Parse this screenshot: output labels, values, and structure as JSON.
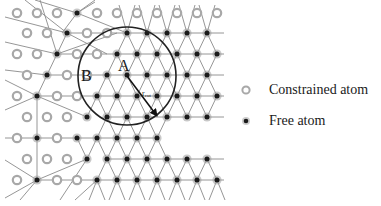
{
  "diagram": {
    "labels": {
      "A": "A",
      "B": "B",
      "r": "r",
      "r_sub": "cut"
    },
    "colors": {
      "bond": "#8a8a8a",
      "circle": "#222222",
      "free_atom": "#1a1a1a",
      "free_halo": "#9a9a9a",
      "constrained_ring": "#a8a8a8",
      "text": "#1a1a1a"
    },
    "cutoff_circle": {
      "cx": 127,
      "cy": 76,
      "r": 49
    },
    "arrow": {
      "x1": 127,
      "y1": 76,
      "x2": 157,
      "y2": 116
    },
    "rows": [
      {
        "y": 13,
        "constrained": [
          17,
          37,
          57,
          97,
          117,
          137,
          157,
          177,
          197,
          217
        ],
        "free": [
          77
        ]
      },
      {
        "y": 33,
        "constrained": [
          27,
          47,
          87,
          107
        ],
        "free": [
          67,
          127,
          147,
          167,
          187,
          207
        ]
      },
      {
        "y": 54,
        "constrained": [
          17,
          37,
          77,
          97
        ],
        "free": [
          57,
          117,
          137,
          157,
          177,
          197,
          217
        ]
      },
      {
        "y": 75,
        "constrained": [
          27,
          67,
          87
        ],
        "free": [
          47,
          107,
          127,
          147,
          167,
          187,
          207
        ]
      },
      {
        "y": 96,
        "constrained": [
          17,
          57,
          77
        ],
        "free": [
          37,
          97,
          117,
          137,
          157,
          177,
          197,
          217
        ]
      },
      {
        "y": 117,
        "constrained": [
          27,
          47,
          67
        ],
        "free": [
          87,
          107,
          127,
          147,
          167,
          187,
          207
        ]
      },
      {
        "y": 138,
        "constrained": [
          17,
          57
        ],
        "free": [
          37,
          77,
          97,
          117,
          137,
          157
        ]
      },
      {
        "y": 159,
        "constrained": [
          27,
          47,
          67
        ],
        "free": [
          87,
          107,
          127,
          147,
          167,
          187,
          207
        ]
      },
      {
        "y": 180,
        "constrained": [
          17,
          57,
          77
        ],
        "free": [
          37,
          97,
          117,
          137,
          157,
          177,
          197,
          217
        ]
      }
    ],
    "extra_bonds": [
      [
        77,
        13,
        35,
        0
      ],
      [
        77,
        13,
        95,
        0
      ],
      [
        77,
        13,
        95,
        2
      ],
      [
        77,
        13,
        62,
        33
      ],
      [
        67,
        33,
        5,
        17
      ],
      [
        67,
        33,
        57,
        54
      ],
      [
        67,
        33,
        127,
        33
      ],
      [
        67,
        33,
        25,
        0
      ],
      [
        57,
        54,
        5,
        42
      ],
      [
        57,
        54,
        47,
        75
      ],
      [
        57,
        54,
        117,
        54
      ],
      [
        57,
        54,
        40,
        0
      ],
      [
        47,
        75,
        5,
        70
      ],
      [
        47,
        75,
        37,
        96
      ],
      [
        47,
        75,
        107,
        75
      ],
      [
        37,
        96,
        5,
        80
      ],
      [
        37,
        96,
        5,
        110
      ],
      [
        37,
        96,
        37,
        138
      ],
      [
        37,
        96,
        97,
        96
      ],
      [
        37,
        96,
        87,
        117
      ],
      [
        37,
        138,
        5,
        138
      ],
      [
        37,
        138,
        77,
        138
      ],
      [
        37,
        138,
        37,
        180
      ],
      [
        37,
        180,
        5,
        160
      ],
      [
        37,
        180,
        5,
        198
      ],
      [
        37,
        180,
        87,
        159
      ],
      [
        37,
        180,
        97,
        180
      ],
      [
        37,
        180,
        20,
        200
      ],
      [
        87,
        159,
        60,
        200
      ],
      [
        97,
        180,
        75,
        200
      ],
      [
        77,
        13,
        127,
        33
      ],
      [
        57,
        54,
        117,
        33
      ],
      [
        67,
        33,
        107,
        54
      ]
    ],
    "legend": {
      "constrained_label": "Constrained atom",
      "free_label": "Free atom"
    }
  }
}
